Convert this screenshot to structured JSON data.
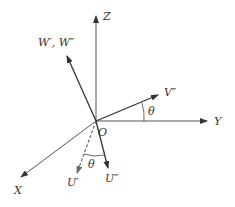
{
  "diagram": {
    "origin_label": "O",
    "axes": {
      "x_label": "X",
      "y_label": "Y",
      "z_label": "Z"
    },
    "vectors": {
      "w_label": "W′, W″",
      "v_label": "V″",
      "u_prime_label": "U′",
      "u_double_label": "U″"
    },
    "angles": {
      "theta_upper": "θ",
      "theta_lower": "θ"
    },
    "colors": {
      "line": "#333333",
      "axis": "#555555",
      "dashed": "#666666",
      "background": "#ffffff"
    }
  }
}
